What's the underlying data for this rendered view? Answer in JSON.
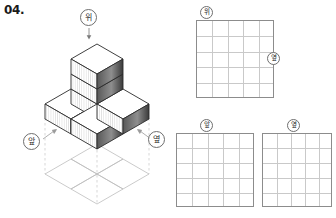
{
  "problem": {
    "number": "04."
  },
  "figure": {
    "name": "isometric-cube-stack",
    "cube_count": 6,
    "cube_positions": [
      {
        "x": 0,
        "y": 0,
        "z": 0
      },
      {
        "x": 1,
        "y": 0,
        "z": 0
      },
      {
        "x": 0,
        "y": 1,
        "z": 0
      },
      {
        "x": 1,
        "y": 1,
        "z": 0
      },
      {
        "x": 1,
        "y": 1,
        "z": 1
      },
      {
        "x": 1,
        "y": 1,
        "z": 2
      }
    ],
    "direction_badges": [
      {
        "id": "top",
        "label": "위",
        "position": "above-figure"
      },
      {
        "id": "front",
        "label": "앞",
        "position": "lower-left"
      },
      {
        "id": "side",
        "label": "옆",
        "position": "lower-right"
      }
    ],
    "arrow": {
      "name": "down-arrow",
      "from": "top-badge",
      "to": "figure-top"
    }
  },
  "grids": [
    {
      "id": "top-view",
      "label": "위",
      "label_position": "top",
      "columns": 5,
      "rows": 5,
      "cells": []
    },
    {
      "id": "side-view-label-on-top-grid",
      "label": "옆",
      "label_position": "right"
    },
    {
      "id": "front-view",
      "label": "앞",
      "label_position": "top",
      "columns": 5,
      "rows": 5,
      "cells": []
    },
    {
      "id": "side-view",
      "label": "옆",
      "label_position": "top",
      "columns": 5,
      "rows": 5,
      "cells": []
    }
  ],
  "colors": {
    "grid_border": "#8c8c8c",
    "grid_line": "#c9c9c9",
    "badge_border": "#6e6e6e",
    "cube_outline": "#2b2b2b",
    "cube_top": "#ffffff",
    "cube_left": "#ffffff",
    "cube_right": "#4a4a4a",
    "projection_line": "#b8b8b8"
  }
}
